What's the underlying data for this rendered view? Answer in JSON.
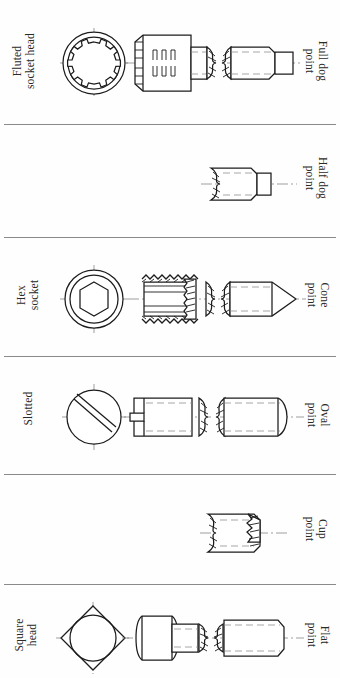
{
  "figure": {
    "orientation": "rotated-90",
    "row_count": 6,
    "line_color": "#1c1c1c",
    "center_line_color": "#777777",
    "background": "#fefefe"
  },
  "rows": [
    {
      "id": "row-1",
      "head_label": {
        "line1": "Fluted",
        "line2": "socket head"
      },
      "point_label": {
        "line1": "Full dog",
        "line2": "point"
      },
      "has_end_view": true,
      "has_body": true,
      "end_view": "fluted-socket-circle",
      "body": "socket-cap-head",
      "point": "full-dog-point"
    },
    {
      "id": "row-2",
      "head_label": {
        "line1": "",
        "line2": ""
      },
      "point_label": {
        "line1": "Half dog",
        "line2": "point"
      },
      "has_end_view": false,
      "has_body": false,
      "end_view": "",
      "body": "",
      "point": "half-dog-point"
    },
    {
      "id": "row-3",
      "head_label": {
        "line1": "Hex",
        "line2": "socket"
      },
      "point_label": {
        "line1": "Cone",
        "line2": "point"
      },
      "has_end_view": true,
      "has_body": true,
      "end_view": "hex-socket-circle",
      "body": "threaded-set-screw",
      "point": "cone-point"
    },
    {
      "id": "row-4",
      "head_label": {
        "line1": "Slotted",
        "line2": ""
      },
      "point_label": {
        "line1": "Oval",
        "line2": "point"
      },
      "has_end_view": true,
      "has_body": true,
      "end_view": "slotted-circle",
      "body": "slotted-set-screw",
      "point": "oval-point"
    },
    {
      "id": "row-5",
      "head_label": {
        "line1": "",
        "line2": ""
      },
      "point_label": {
        "line1": "Cup",
        "line2": "point"
      },
      "has_end_view": false,
      "has_body": false,
      "end_view": "",
      "body": "",
      "point": "cup-point"
    },
    {
      "id": "row-6",
      "head_label": {
        "line1": "Square",
        "line2": "head"
      },
      "point_label": {
        "line1": "Flat",
        "line2": "point"
      },
      "has_end_view": true,
      "has_body": true,
      "end_view": "square-head-circle",
      "body": "square-head-side",
      "point": "flat-point"
    }
  ]
}
